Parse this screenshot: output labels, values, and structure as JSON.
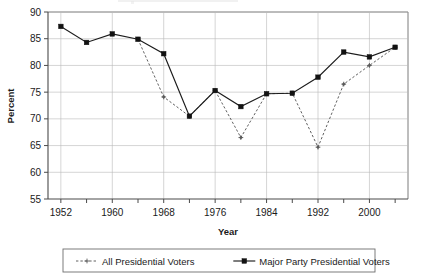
{
  "chart_data": {
    "type": "line",
    "title": "",
    "xlabel": "Year",
    "ylabel": "Percent",
    "xlim": [
      1950,
      2006
    ],
    "ylim": [
      55,
      90
    ],
    "ytick_values": [
      55,
      60,
      65,
      70,
      75,
      80,
      85,
      90
    ],
    "ytick_labels": [
      "55",
      "60",
      "65",
      "70",
      "75",
      "80",
      "85",
      "90"
    ],
    "xtick_values": [
      1952,
      1956,
      1960,
      1964,
      1968,
      1972,
      1976,
      1980,
      1984,
      1988,
      1992,
      1996,
      2000,
      2004
    ],
    "xtick_labels": [
      "1952",
      "",
      "1960",
      "",
      "1968",
      "",
      "1976",
      "",
      "1984",
      "",
      "1992",
      "",
      "2000",
      ""
    ],
    "xtick_labeled_values": [
      1952,
      1960,
      1968,
      1976,
      1984,
      1992,
      2000
    ],
    "grid": true,
    "legend_position": "bottom",
    "x": [
      1952,
      1956,
      1960,
      1964,
      1968,
      1972,
      1976,
      1980,
      1984,
      1988,
      1992,
      1996,
      2000,
      2004
    ],
    "series": [
      {
        "name": "All Presidential Voters",
        "style": "dashed",
        "marker": "plus",
        "color": "#5a5a5a",
        "x": [
          1964,
          1968,
          1972,
          1976,
          1980,
          1984,
          1988,
          1992,
          1996,
          2000,
          2004
        ],
        "values": [
          84.9,
          74.1,
          70.5,
          75.3,
          66.5,
          74.7,
          74.8,
          64.7,
          76.5,
          80.0,
          83.4
        ]
      },
      {
        "name": "Major Party Presidential Voters",
        "style": "solid",
        "marker": "square",
        "color": "#121212",
        "x": [
          1952,
          1956,
          1960,
          1964,
          1968,
          1972,
          1976,
          1980,
          1984,
          1988,
          1992,
          1996,
          2000,
          2004
        ],
        "values": [
          87.3,
          84.3,
          85.9,
          84.9,
          82.2,
          70.5,
          75.3,
          72.3,
          74.7,
          74.8,
          77.8,
          82.5,
          81.6,
          83.4
        ]
      }
    ]
  },
  "legend": {
    "items": [
      {
        "label": "All Presidential Voters",
        "marker": "plus-marker",
        "style": "dashed"
      },
      {
        "label": "Major Party Presidential Voters",
        "marker": "square-marker",
        "style": "solid"
      }
    ]
  },
  "axis": {
    "y_title": "Percent",
    "x_title": "Year"
  }
}
